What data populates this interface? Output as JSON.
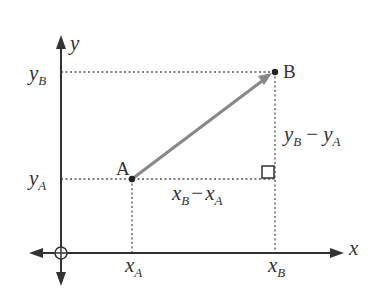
{
  "diagram": {
    "title": "",
    "axes": {
      "x_label": "x",
      "y_label": "y",
      "origin_symbol": "circle-plus"
    },
    "points": {
      "A": {
        "label": "A"
      },
      "B": {
        "label": "B"
      }
    },
    "labels": {
      "yB": {
        "main": "y",
        "sub": "B"
      },
      "yA": {
        "main": "y",
        "sub": "A"
      },
      "xA": {
        "main": "x",
        "sub": "A"
      },
      "xB": {
        "main": "x",
        "sub": "B"
      },
      "dx": {
        "m1": "x",
        "s1": "B",
        "op": "−",
        "m2": "x",
        "s2": "A"
      },
      "dy": {
        "m1": "y",
        "s1": "B",
        "op": "−",
        "m2": "y",
        "s2": "A"
      }
    },
    "colors": {
      "axis": "#333333",
      "vector": "#888888",
      "dotted": "#555555",
      "point": "#222222"
    }
  }
}
